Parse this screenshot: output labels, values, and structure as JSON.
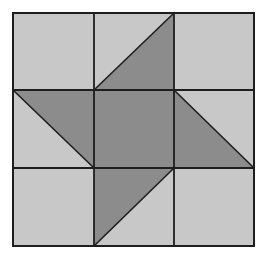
{
  "diagram": {
    "type": "quilt-block",
    "grid": {
      "rows": 3,
      "cols": 3
    },
    "bounds": {
      "x0": 13,
      "y0": 13,
      "x1": 254,
      "y1": 246
    },
    "lines": {
      "vx": [
        94,
        174
      ],
      "hy": [
        90,
        168
      ]
    },
    "colors": {
      "light": "#c8c8c8",
      "dark": "#8c8c8c",
      "stroke": "#1e1e1e",
      "background": "#ffffff"
    },
    "dark_shapes": [
      {
        "name": "center-square",
        "points": "94,90 174,90 174,168 94,168"
      },
      {
        "name": "top-triangle",
        "points": "94,90 174,13 174,90"
      },
      {
        "name": "right-triangle",
        "points": "174,90 254,168 174,168"
      },
      {
        "name": "bottom-triangle",
        "points": "94,168 174,168 94,246"
      },
      {
        "name": "left-triangle",
        "points": "13,90 94,90 94,168"
      }
    ],
    "diagonals": [
      {
        "name": "top-diagonal",
        "x1": 94,
        "y1": 90,
        "x2": 174,
        "y2": 13
      },
      {
        "name": "right-diagonal",
        "x1": 174,
        "y1": 90,
        "x2": 254,
        "y2": 168
      },
      {
        "name": "bottom-diagonal",
        "x1": 94,
        "y1": 246,
        "x2": 174,
        "y2": 168
      },
      {
        "name": "left-diagonal",
        "x1": 13,
        "y1": 90,
        "x2": 94,
        "y2": 168
      }
    ]
  }
}
